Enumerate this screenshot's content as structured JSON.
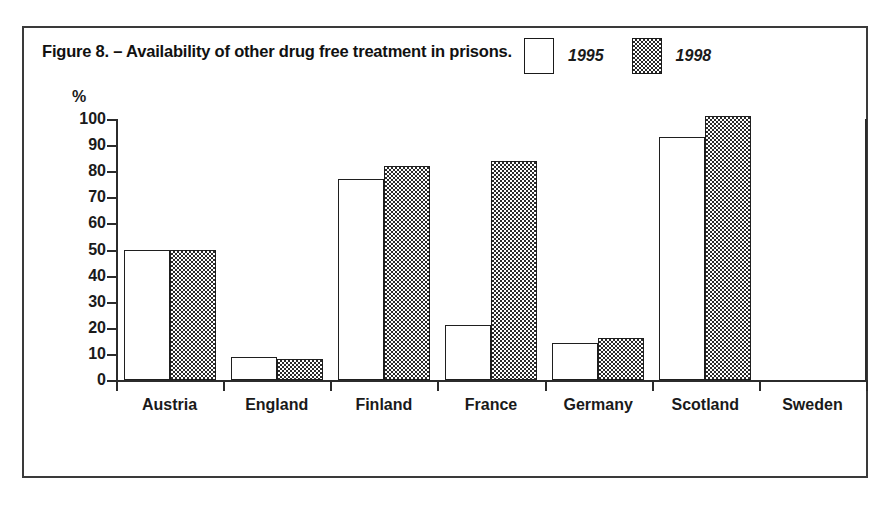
{
  "figure": {
    "caption": "Figure 8. – Availability of other drug free treatment in prisons."
  },
  "legend": {
    "entries": [
      {
        "label": "1995",
        "swatch": "white-square-icon"
      },
      {
        "label": "1998",
        "swatch": "checkered-square-icon"
      }
    ]
  },
  "axes": {
    "y_unit": "%",
    "y_ticks": [
      "100",
      "90",
      "80",
      "70",
      "60",
      "50",
      "40",
      "30",
      "20",
      "10",
      "0"
    ]
  },
  "chart_data": {
    "type": "bar",
    "title": "Figure 8. – Availability of other drug free treatment in prisons.",
    "xlabel": "",
    "ylabel": "%",
    "ylim": [
      0,
      100
    ],
    "grid": false,
    "legend_position": "top-right",
    "categories": [
      "Austria",
      "England",
      "Finland",
      "France",
      "Germany",
      "Scotland",
      "Sweden"
    ],
    "series": [
      {
        "name": "1995",
        "values": [
          50,
          9,
          77,
          21,
          14,
          93,
          0
        ]
      },
      {
        "name": "1998",
        "values": [
          50,
          8,
          82,
          84,
          16,
          101,
          0
        ]
      }
    ]
  },
  "colors": {
    "ink": "#1f1f1f",
    "frame": "#3a3a3a",
    "series_1995_fill": "#ffffff",
    "series_1998_fill": "#2b2b2b",
    "page_background": "#ffffff"
  }
}
